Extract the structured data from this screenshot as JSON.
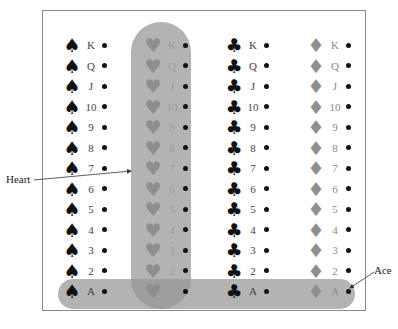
{
  "diagram": {
    "title": "",
    "ranks": [
      "K",
      "Q",
      "J",
      "10",
      "9",
      "8",
      "7",
      "6",
      "5",
      "4",
      "3",
      "2",
      "A"
    ],
    "suits": [
      {
        "name": "spade",
        "glyph": "♠",
        "color": "#111111"
      },
      {
        "name": "heart",
        "glyph": "♥",
        "color": "#8e8e8e"
      },
      {
        "name": "club",
        "glyph": "♣",
        "color": "#111111"
      },
      {
        "name": "diamond",
        "glyph": "♦",
        "color": "#8f8f8f"
      }
    ],
    "highlights": [
      {
        "name": "heart-column",
        "label": "Heart",
        "color": "#969696"
      },
      {
        "name": "ace-row",
        "label": "Ace",
        "color": "#969696"
      }
    ],
    "annotations": {
      "heart_label": "Heart",
      "ace_label": "Ace"
    }
  }
}
